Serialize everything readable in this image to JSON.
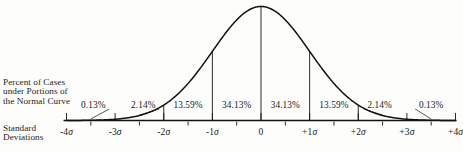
{
  "figure": {
    "percent_caption": "Percent of Cases\nunder Portions of\nthe Normal Curve",
    "stddev_caption": "Standard\nDeviations"
  },
  "chart_data": {
    "type": "area",
    "title": "",
    "subtitle": "",
    "xlabel": "Standard Deviations",
    "ylabel": "Percent of Cases under Portions of the Normal Curve",
    "xlim": [
      -4,
      4
    ],
    "ylim": [
      0,
      1
    ],
    "grid": false,
    "legend": null,
    "curve": "normal",
    "x_ticks": [
      "-4σ",
      "-3σ",
      "-2σ",
      "-1σ",
      "0",
      "+1σ",
      "+2σ",
      "+3σ",
      "+4σ"
    ],
    "x_tick_values": [
      -4,
      -3,
      -2,
      -1,
      0,
      1,
      2,
      3,
      4
    ],
    "minor_tick_values": [
      -3.5,
      -2.5,
      -1.5,
      -0.5,
      0.5,
      1.5,
      2.5,
      3.5
    ],
    "divider_values": [
      -2,
      -1,
      0,
      1,
      2
    ],
    "bands": [
      {
        "from": -4,
        "to": -3,
        "label": "0.13%",
        "value": 0.13,
        "label_x": -3.45,
        "leader": true
      },
      {
        "from": -3,
        "to": -2,
        "label": "2.14%",
        "value": 2.14,
        "label_x": -2.42,
        "leader": true
      },
      {
        "from": -2,
        "to": -1,
        "label": "13.59%",
        "value": 13.59,
        "label_x": -1.5,
        "leader": false
      },
      {
        "from": -1,
        "to": 0,
        "label": "34.13%",
        "value": 34.13,
        "label_x": -0.5,
        "leader": false
      },
      {
        "from": 0,
        "to": 1,
        "label": "34.13%",
        "value": 34.13,
        "label_x": 0.5,
        "leader": false
      },
      {
        "from": 1,
        "to": 2,
        "label": "13.59%",
        "value": 13.59,
        "label_x": 1.5,
        "leader": false
      },
      {
        "from": 2,
        "to": 3,
        "label": "2.14%",
        "value": 2.14,
        "label_x": 2.44,
        "leader": true
      },
      {
        "from": 3,
        "to": 4,
        "label": "0.13%",
        "value": 0.13,
        "label_x": 3.5,
        "leader": true
      }
    ],
    "colors": {
      "curve": "#121212",
      "axis": "#121212",
      "text": "#1b1b1b",
      "background": "#fdfdfb"
    }
  }
}
